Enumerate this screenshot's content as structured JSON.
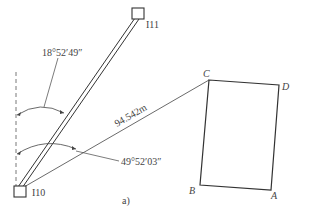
{
  "figure": {
    "caption": "a)",
    "stations": [
      {
        "id": "I10",
        "label": "I10"
      },
      {
        "id": "I11",
        "label": "I11"
      }
    ],
    "angles": [
      {
        "id": "angle-to-I11",
        "label": "18°52′49″"
      },
      {
        "id": "angle-to-C",
        "label": "49°52′03″"
      }
    ],
    "distance": {
      "label": "94.542m",
      "from": "I10",
      "to": "C"
    },
    "building_corners": [
      {
        "id": "A",
        "label": "A"
      },
      {
        "id": "B",
        "label": "B"
      },
      {
        "id": "C",
        "label": "C"
      },
      {
        "id": "D",
        "label": "D"
      }
    ],
    "colors": {
      "line": "#333333",
      "text": "#444444",
      "background": "#ffffff"
    }
  }
}
